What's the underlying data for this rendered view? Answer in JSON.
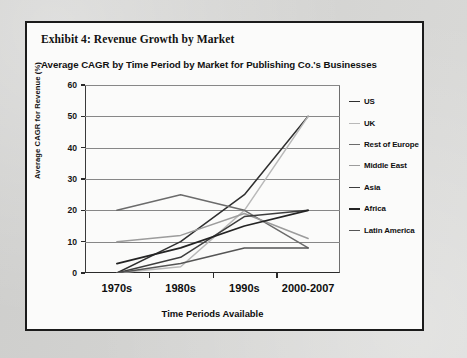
{
  "exhibit": {
    "title": "Exhibit 4: Revenue Growth by Market",
    "border_color": "#1b1b1b",
    "page_background": "#d8d8d6",
    "panel_background": "#fbfbfa"
  },
  "chart_data": {
    "type": "line",
    "title": "Average CAGR by Time Period by Market for Publishing Co.'s Businesses",
    "xlabel": "Time Periods Available",
    "ylabel": "Average CAGR for Revenue (%)",
    "categories": [
      "1970s",
      "1980s",
      "1990s",
      "2000-2007"
    ],
    "ylim": [
      0,
      60
    ],
    "yticks": [
      0,
      10,
      20,
      30,
      40,
      50,
      60
    ],
    "ytick_labels": [
      "0",
      "10",
      "20",
      "30",
      "40",
      "50",
      "60"
    ],
    "grid": true,
    "grid_axis": "y",
    "legend_position": "right",
    "series": [
      {
        "name": "US",
        "values": [
          0,
          10,
          25,
          50
        ],
        "color": "#2f2f2f",
        "width": 1.5
      },
      {
        "name": "UK",
        "values": [
          0,
          2,
          20,
          50
        ],
        "color": "#b9b9b9",
        "width": 1.5
      },
      {
        "name": "Rest of Europe",
        "values": [
          20,
          25,
          20,
          8
        ],
        "color": "#6b6b6b",
        "width": 1.5
      },
      {
        "name": "Middle East",
        "values": [
          10,
          12,
          19,
          11
        ],
        "color": "#9c9c9c",
        "width": 1.5
      },
      {
        "name": "Asia",
        "values": [
          0,
          5,
          18,
          20
        ],
        "color": "#3d3d3d",
        "width": 1.5
      },
      {
        "name": "Africa",
        "values": [
          3,
          8,
          15,
          20
        ],
        "color": "#242424",
        "width": 1.8
      },
      {
        "name": "Latin America",
        "values": [
          0,
          3,
          8,
          8
        ],
        "color": "#555555",
        "width": 1.5
      }
    ]
  }
}
